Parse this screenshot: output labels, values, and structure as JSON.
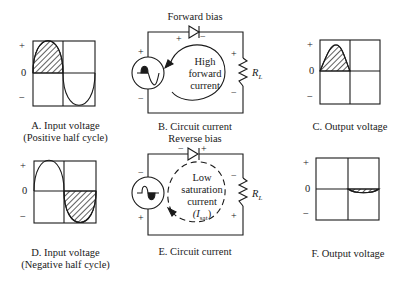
{
  "panels": {
    "A": {
      "caption_line1": "A. Input voltage",
      "caption_line2": "(Positive half cycle)"
    },
    "B": {
      "caption": "B. Circuit current",
      "bias_label": "Forward bias",
      "current_line1": "High",
      "current_line2": "forward",
      "current_line3": "current",
      "resistor_label": "R",
      "resistor_sub": "L"
    },
    "C": {
      "caption": "C. Output voltage"
    },
    "D": {
      "caption_line1": "D. Input voltage",
      "caption_line2": "(Negative half cycle)"
    },
    "E": {
      "caption": "E. Circuit current",
      "bias_label": "Reverse bias",
      "current_line1": "Low",
      "current_line2": "saturation",
      "current_line3": "current",
      "current_line4": "(I",
      "current_line4_sub": "sat",
      "current_line4_end": ")",
      "resistor_label": "R",
      "resistor_sub": "L"
    },
    "F": {
      "caption": "F. Output voltage"
    }
  },
  "axis": {
    "plus": "+",
    "zero": "0",
    "minus": "−"
  },
  "colors": {
    "line": "#1a1a1a",
    "background": "#ffffff"
  }
}
